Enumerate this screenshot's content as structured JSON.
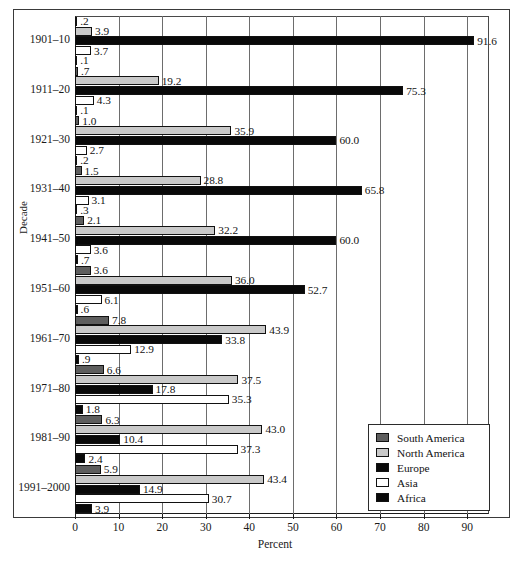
{
  "chart_data": {
    "type": "bar",
    "orientation": "horizontal",
    "title": "",
    "xlabel": "Percent",
    "ylabel": "Decade",
    "xlim": [
      0,
      95
    ],
    "xticks": [
      0,
      10,
      20,
      30,
      40,
      50,
      60,
      70,
      80,
      90
    ],
    "grid": true,
    "legend_position": "bottom-right",
    "categories": [
      "1901–10",
      "1911–20",
      "1921–30",
      "1931–40",
      "1941–50",
      "1951–60",
      "1961–70",
      "1971–80",
      "1981–90",
      "1991–2000"
    ],
    "series": [
      {
        "name": "South America",
        "color": "#5e5e5e",
        "fill_class": "s-south",
        "values": [
          0.2,
          0.7,
          1.0,
          1.5,
          2.1,
          3.6,
          7.8,
          6.6,
          6.3,
          5.9
        ],
        "labels": [
          ".2",
          ".7",
          "1.0",
          "1.5",
          "2.1",
          "3.6",
          "7.8",
          "6.6",
          "6.3",
          "5.9"
        ]
      },
      {
        "name": "North America",
        "color": "#c9c9c9",
        "fill_class": "s-north",
        "values": [
          3.9,
          19.2,
          35.9,
          28.8,
          32.2,
          36.0,
          43.9,
          37.5,
          43.0,
          43.4
        ],
        "labels": [
          "3.9",
          "19.2",
          "35.9",
          "28.8",
          "32.2",
          "36.0",
          "43.9",
          "37.5",
          "43.0",
          "43.4"
        ]
      },
      {
        "name": "Europe",
        "color": "#090909",
        "fill_class": "s-europe",
        "values": [
          91.6,
          75.3,
          60.0,
          65.8,
          60.0,
          52.7,
          33.8,
          17.8,
          10.4,
          14.9
        ],
        "labels": [
          "91.6",
          "75.3",
          "60.0",
          "65.8",
          "60.0",
          "52.7",
          "33.8",
          "17.8",
          "10.4",
          "14.9"
        ]
      },
      {
        "name": "Asia",
        "color": "#ffffff",
        "fill_class": "s-asia",
        "values": [
          3.7,
          4.3,
          2.7,
          3.1,
          3.6,
          6.1,
          12.9,
          35.3,
          37.3,
          30.7
        ],
        "labels": [
          "3.7",
          "4.3",
          "2.7",
          "3.1",
          "3.6",
          "6.1",
          "12.9",
          "35.3",
          "37.3",
          "30.7"
        ]
      },
      {
        "name": "Africa",
        "color": "#090909",
        "fill_class": "s-africa",
        "values": [
          0.1,
          0.1,
          0.2,
          0.3,
          0.7,
          0.6,
          0.9,
          1.8,
          2.4,
          3.9
        ],
        "labels": [
          ".1",
          ".1",
          ".2",
          ".3",
          ".7",
          ".6",
          ".9",
          "1.8",
          "2.4",
          "3.9"
        ]
      }
    ]
  },
  "axes": {
    "x_title": "Percent",
    "y_title": "Decade",
    "x_tick_labels": [
      "0",
      "10",
      "20",
      "30",
      "40",
      "50",
      "60",
      "70",
      "80",
      "90"
    ]
  },
  "legend": {
    "items": [
      {
        "label": "South America",
        "fill_class": "s-south"
      },
      {
        "label": "North America",
        "fill_class": "s-north"
      },
      {
        "label": "Europe",
        "fill_class": "s-europe"
      },
      {
        "label": "Asia",
        "fill_class": "s-asia"
      },
      {
        "label": "Africa",
        "fill_class": "s-africa"
      }
    ]
  }
}
